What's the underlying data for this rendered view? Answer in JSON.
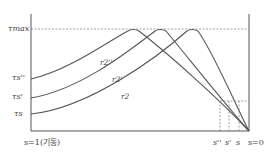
{
  "diagram": {
    "y_labels": {
      "tau_max": "τmax",
      "tau_s_dprime": "τs''",
      "tau_s_prime": "τs'",
      "tau_s": "τs"
    },
    "curve_labels": {
      "r2_dprime": "r2''",
      "r2_prime": "r2'",
      "r2": "r2"
    },
    "x_labels": {
      "left": "s=1(기동)",
      "s_dprime": "s''",
      "s_prime": "s'",
      "s": "s",
      "right": "s=0"
    },
    "colors": {
      "line": "#555555",
      "dashed": "#888888",
      "background": "#ffffff"
    }
  }
}
